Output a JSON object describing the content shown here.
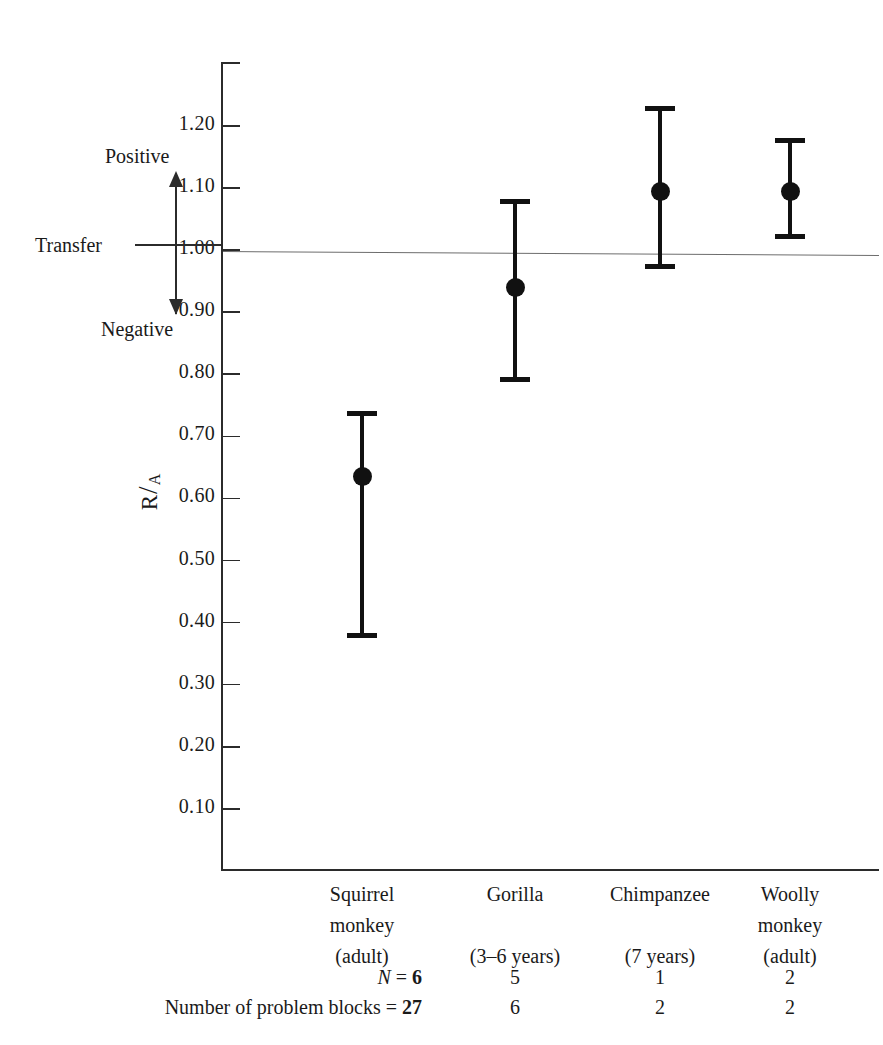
{
  "chart_data": {
    "type": "scatter",
    "title": "",
    "xlabel": "",
    "ylabel": "R/A",
    "ylim": [
      0.0,
      1.27
    ],
    "grid": false,
    "legend": null,
    "reference_line": {
      "value": 1.0,
      "label": "Transfer"
    },
    "y_ticks": [
      "1.20",
      "1.10",
      "1.00",
      "0.90",
      "0.80",
      "0.70",
      "0.60",
      "0.50",
      "0.40",
      "0.30",
      "0.20",
      "0.10"
    ],
    "y_tick_values": [
      1.2,
      1.1,
      1.0,
      0.9,
      0.8,
      0.7,
      0.6,
      0.5,
      0.4,
      0.3,
      0.2,
      0.1
    ],
    "categories": [
      "Squirrel monkey (adult)",
      "Gorilla (3–6 years)",
      "Chimpanzee (7 years)",
      "Woolly monkey (adult)"
    ],
    "values": [
      0.635,
      0.94,
      1.095,
      1.095
    ],
    "error_low": [
      0.375,
      0.788,
      0.97,
      1.018
    ],
    "error_high": [
      0.74,
      1.082,
      1.232,
      1.18
    ],
    "annotations": [
      "Positive",
      "Transfer",
      "Negative"
    ]
  },
  "axis": {
    "y_title_main": "R",
    "y_title_slash": "/",
    "y_title_sub": "A"
  },
  "transfer_annotation": {
    "positive": "Positive",
    "transfer": "Transfer",
    "negative": "Negative"
  },
  "categories": [
    {
      "line1": "Squirrel",
      "line2": "monkey",
      "line3": "(adult)"
    },
    {
      "line1": "Gorilla",
      "line2": "",
      "line3": "(3–6 years)"
    },
    {
      "line1": "Chimpanzee",
      "line2": "",
      "line3": "(7 years)"
    },
    {
      "line1": "Woolly",
      "line2": "monkey",
      "line3": "(adult)"
    }
  ],
  "footer": {
    "rows": [
      {
        "label_prefix": "N",
        "label_suffix": " = ",
        "first_value": "6",
        "values": [
          "5",
          "1",
          "2"
        ]
      },
      {
        "label_prefix": "Number of problem blocks",
        "label_suffix": " = ",
        "first_value": "27",
        "values": [
          "6",
          "2",
          "2"
        ]
      }
    ]
  }
}
